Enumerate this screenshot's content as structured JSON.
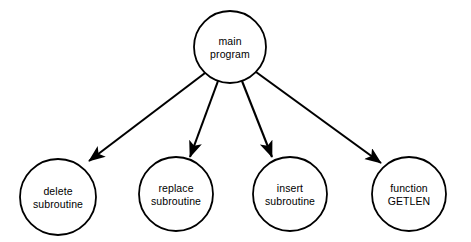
{
  "diagram": {
    "type": "call-hierarchy-diagram",
    "background_color": "#ffffff",
    "stroke_color": "#000000",
    "nodes": [
      {
        "id": "main-program",
        "label_line1": "main",
        "label_line2": "program",
        "shape": "circle",
        "cx": 230,
        "cy": 47,
        "r": 36
      },
      {
        "id": "delete-subroutine",
        "label_line1": "delete",
        "label_line2": "subroutine",
        "shape": "circle",
        "cx": 58,
        "cy": 197,
        "r": 38
      },
      {
        "id": "replace-subroutine",
        "label_line1": "replace",
        "label_line2": "subroutine",
        "shape": "circle",
        "cx": 176,
        "cy": 194,
        "r": 37
      },
      {
        "id": "insert-subroutine",
        "label_line1": "insert",
        "label_line2": "subroutine",
        "shape": "circle",
        "cx": 290,
        "cy": 194,
        "r": 37
      },
      {
        "id": "function-getlen",
        "label_line1": "function",
        "label_line2": "GETLEN",
        "shape": "circle",
        "cx": 409,
        "cy": 194,
        "r": 37
      }
    ],
    "edges": [
      {
        "id": "edge-main-to-delete",
        "from": "main-program",
        "to": "delete-subroutine",
        "x1": 205,
        "y1": 73,
        "x2": 89,
        "y2": 161,
        "arrow": true
      },
      {
        "id": "edge-main-to-replace",
        "from": "main-program",
        "to": "replace-subroutine",
        "x1": 218,
        "y1": 81,
        "x2": 190,
        "y2": 157,
        "arrow": true
      },
      {
        "id": "edge-main-to-insert",
        "from": "main-program",
        "to": "insert-subroutine",
        "x1": 242,
        "y1": 81,
        "x2": 272,
        "y2": 157,
        "arrow": true
      },
      {
        "id": "edge-main-to-getlen",
        "from": "main-program",
        "to": "function-getlen",
        "x1": 256,
        "y1": 72,
        "x2": 381,
        "y2": 163,
        "arrow": true
      }
    ]
  }
}
